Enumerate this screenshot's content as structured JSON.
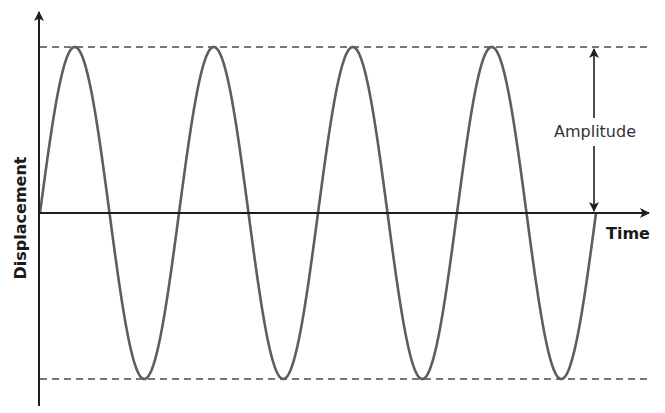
{
  "diagram": {
    "title": "",
    "x_axis_label": "Time",
    "y_axis_label": "Displacement",
    "annotation_label": "Amplitude",
    "colors": {
      "axis": "#1e1e1e",
      "wave": "#5e5e5e",
      "dashed_guides": "#777777",
      "arrow": "#1e1e1e",
      "text": "#1a1a1a"
    }
  },
  "chart_data": {
    "type": "line",
    "title": "",
    "xlabel": "Time",
    "ylabel": "Displacement",
    "series": [
      {
        "name": "wave",
        "function": "sine",
        "amplitude": 1,
        "cycles": 4,
        "phase": 0
      }
    ],
    "guides": [
      {
        "type": "dashed-horizontal",
        "value": 1
      },
      {
        "type": "dashed-horizontal",
        "value": -1
      }
    ],
    "annotations": [
      {
        "text": "Amplitude",
        "type": "double-arrow",
        "from": 0,
        "to": 1
      }
    ],
    "grid": false,
    "ticks": false
  }
}
